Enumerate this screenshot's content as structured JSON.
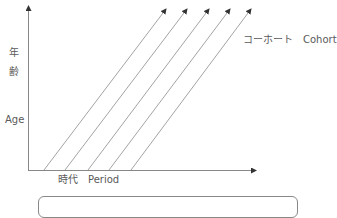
{
  "diagram": {
    "type": "lexis-diagram",
    "y_axis": {
      "label_ja_1": "年",
      "label_ja_2": "齢",
      "label_en": "Age"
    },
    "x_axis": {
      "label": "時代　Period"
    },
    "cohort_label": "コーホート　Cohort",
    "cohort_lines": [
      {
        "x1": 44,
        "y1": 170,
        "x2": 166,
        "y2": 9
      },
      {
        "x1": 65,
        "y1": 170,
        "x2": 187,
        "y2": 9
      },
      {
        "x1": 88,
        "y1": 170,
        "x2": 209,
        "y2": 9
      },
      {
        "x1": 109,
        "y1": 170,
        "x2": 230,
        "y2": 9
      },
      {
        "x1": 131,
        "y1": 170,
        "x2": 251,
        "y2": 9
      }
    ],
    "colors": {
      "axis": "#888888",
      "line": "#999999",
      "arrow": "#333333",
      "text": "#5a5a5a"
    }
  }
}
